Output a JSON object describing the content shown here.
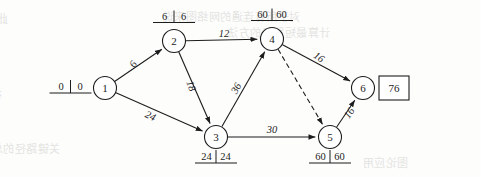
{
  "diagram": {
    "project_duration": "76",
    "nodes": [
      {
        "id": "n1",
        "label": "1",
        "cx": 105,
        "cy": 88,
        "times": {
          "early": "0",
          "late": "0",
          "pos": "left"
        }
      },
      {
        "id": "n2",
        "label": "2",
        "cx": 174,
        "cy": 41,
        "times": {
          "early": "6",
          "late": "6",
          "pos": "top"
        }
      },
      {
        "id": "n3",
        "label": "3",
        "cx": 216,
        "cy": 137,
        "times": {
          "early": "24",
          "late": "24",
          "pos": "bottom"
        }
      },
      {
        "id": "n4",
        "label": "4",
        "cx": 272,
        "cy": 39,
        "times": {
          "early": "60",
          "late": "60",
          "pos": "top"
        }
      },
      {
        "id": "n5",
        "label": "5",
        "cx": 330,
        "cy": 137,
        "times": {
          "early": "60",
          "late": "60",
          "pos": "bottom"
        }
      },
      {
        "id": "n6",
        "label": "6",
        "cx": 363,
        "cy": 88,
        "times": null
      }
    ],
    "edges": [
      {
        "id": "e12",
        "from": "1",
        "to": "2",
        "label": "6",
        "style": "solid",
        "lx": 136,
        "ly": 66,
        "rot": -56
      },
      {
        "id": "e13",
        "from": "1",
        "to": "3",
        "label": "24",
        "style": "solid",
        "lx": 149,
        "ly": 119,
        "rot": 25
      },
      {
        "id": "e24",
        "from": "2",
        "to": "4",
        "label": "12",
        "style": "solid",
        "lx": 224,
        "ly": 37,
        "rot": 0
      },
      {
        "id": "e23",
        "from": "2",
        "to": "3",
        "label": "18",
        "style": "solid",
        "lx": 188,
        "ly": 87,
        "rot": 71
      },
      {
        "id": "e34",
        "from": "3",
        "to": "4",
        "label": "36",
        "style": "solid",
        "lx": 239,
        "ly": 90,
        "rot": -60
      },
      {
        "id": "e35",
        "from": "3",
        "to": "5",
        "label": "30",
        "style": "solid",
        "lx": 272,
        "ly": 133,
        "rot": 0
      },
      {
        "id": "e46",
        "from": "4",
        "to": "6",
        "label": "16",
        "style": "solid",
        "lx": 317,
        "ly": 60,
        "rot": 34
      },
      {
        "id": "e45",
        "from": "4",
        "to": "5",
        "label": "",
        "style": "dashed",
        "lx": 305,
        "ly": 88,
        "rot": 0
      },
      {
        "id": "e56",
        "from": "5",
        "to": "6",
        "label": "16",
        "style": "solid",
        "lx": 352,
        "ly": 115,
        "rot": -56
      }
    ],
    "finish_box": {
      "value": "76",
      "x": 379,
      "y": 76,
      "w": 30,
      "h": 24
    },
    "background_ghost_text": [
      {
        "text": "此时候，有关运算符号的执行",
        "x": 8,
        "y": 10,
        "size": 11
      },
      {
        "text": "对于所有连通的网络图来说",
        "x": 300,
        "y": 8,
        "size": 11
      },
      {
        "text": "计算最短路径的方法",
        "x": 330,
        "y": 24,
        "size": 11
      },
      {
        "text": "在此基础上继续进行",
        "x": 2,
        "y": 86,
        "size": 11
      },
      {
        "text": "对网络图的边进行权值排序",
        "x": 0,
        "y": 104,
        "size": 11
      },
      {
        "text": "关键路径的总时长为",
        "x": 60,
        "y": 140,
        "size": 11
      },
      {
        "text": "图论应用",
        "x": 408,
        "y": 154,
        "size": 11
      }
    ]
  }
}
